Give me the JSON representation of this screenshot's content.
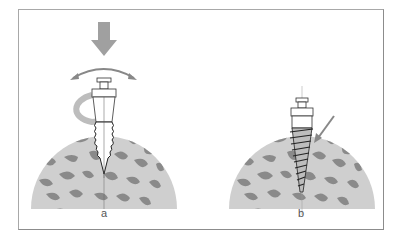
{
  "figure": {
    "panels": [
      {
        "id": "a",
        "label": "a",
        "description": "Self-drilling screw inserted with downward pressure and rotation"
      },
      {
        "id": "b",
        "label": "b",
        "description": "Screw fully seated in bone with arrow indicating cortical contact"
      }
    ],
    "colors": {
      "bone_background": "#cfcfcf",
      "trabecular": "#8a8a8a",
      "arrow": "#9a9a9a",
      "border": "#a8a8a8",
      "screw_outline": "#333333"
    }
  }
}
